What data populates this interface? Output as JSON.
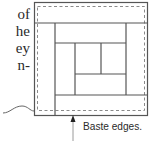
{
  "text_fragments": [
    {
      "text": "of",
      "top": 6
    },
    {
      "text": "he",
      "top": 23
    },
    {
      "text": "ey",
      "top": 40
    },
    {
      "text": "n-",
      "top": 57
    }
  ],
  "caption": "Baste edges.",
  "colors": {
    "line": "#555555",
    "dashed": "#8a8a8a",
    "text": "#2a2a2a"
  }
}
